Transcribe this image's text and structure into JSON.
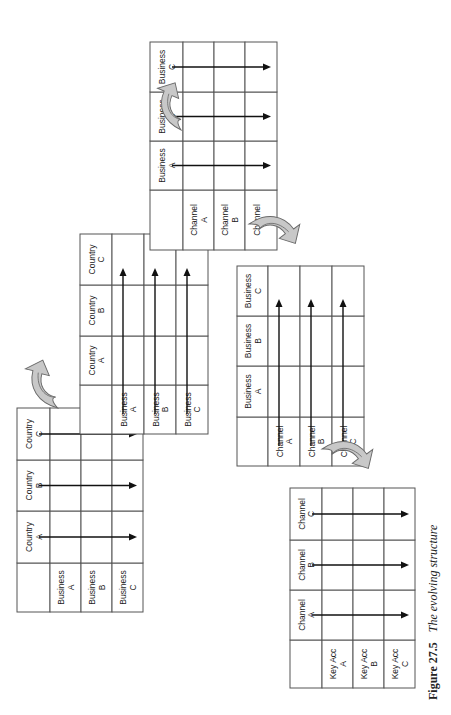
{
  "figure": {
    "number": "Figure 27.5",
    "title": "The evolving structure",
    "orientation": "rotated 90 degrees (landscape figure on portrait page)"
  },
  "matrices": [
    {
      "id": "stage-1",
      "row_labels": [
        [
          "Business",
          "A"
        ],
        [
          "Business",
          "B"
        ],
        [
          "Business",
          "C"
        ]
      ],
      "col_labels": [
        [
          "Country",
          "A"
        ],
        [
          "Country",
          "B"
        ],
        [
          "Country",
          "C"
        ]
      ],
      "arrow_direction": "down-columns",
      "arrows_from": "column headers"
    },
    {
      "id": "stage-2",
      "row_labels": [
        [
          "Business",
          "A"
        ],
        [
          "Business",
          "B"
        ],
        [
          "Business",
          "C"
        ]
      ],
      "col_labels": [
        [
          "Country",
          "A"
        ],
        [
          "Country",
          "B"
        ],
        [
          "Country",
          "C"
        ]
      ],
      "arrow_direction": "across-rows",
      "arrows_from": "row headers"
    },
    {
      "id": "stage-3",
      "row_labels": [
        [
          "Channel",
          "A"
        ],
        [
          "Channel",
          "B"
        ],
        [
          "Channel",
          "C"
        ]
      ],
      "col_labels": [
        [
          "Business",
          "A"
        ],
        [
          "Business",
          "B"
        ],
        [
          "Business",
          "C"
        ]
      ],
      "arrow_direction": "down-columns",
      "arrows_from": "column headers"
    },
    {
      "id": "stage-4",
      "row_labels": [
        [
          "Channel",
          "A"
        ],
        [
          "Channel",
          "B"
        ],
        [
          "Channel",
          "C"
        ]
      ],
      "col_labels": [
        [
          "Business",
          "A"
        ],
        [
          "Business",
          "B"
        ],
        [
          "Business",
          "C"
        ]
      ],
      "arrow_direction": "across-rows",
      "arrows_from": "row headers"
    },
    {
      "id": "stage-5",
      "row_labels": [
        [
          "Key Acc",
          "A"
        ],
        [
          "Key Acc",
          "B"
        ],
        [
          "Key Acc",
          "C"
        ]
      ],
      "col_labels": [
        [
          "Channel",
          "A"
        ],
        [
          "Channel",
          "B"
        ],
        [
          "Channel",
          "C"
        ]
      ],
      "arrow_direction": "down-columns",
      "arrows_from": "column headers"
    }
  ],
  "transitions": [
    {
      "from": "stage-1",
      "to": "stage-2",
      "icon": "curved-arrow-icon"
    },
    {
      "from": "stage-2",
      "to": "stage-3",
      "icon": "curved-arrow-icon"
    },
    {
      "from": "stage-3",
      "to": "stage-4",
      "icon": "curved-arrow-icon"
    },
    {
      "from": "stage-4",
      "to": "stage-5",
      "icon": "curved-arrow-icon"
    }
  ],
  "colors": {
    "grid_line": "#555555",
    "arrow": "#111111",
    "curved_arrow_fill": "#c8c8c8",
    "curved_arrow_stroke": "#6a6a6a",
    "background": "#ffffff"
  }
}
